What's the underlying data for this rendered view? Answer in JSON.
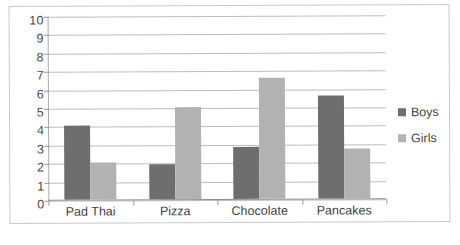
{
  "chart_data": {
    "type": "bar",
    "title": "",
    "subtitle": "",
    "xlabel": "",
    "ylabel": "",
    "categories": [
      "Pad Thai",
      "Pizza",
      "Chocolate",
      "Pancakes"
    ],
    "series": [
      {
        "name": "Boys",
        "color": "#6e6e6e",
        "values": [
          4.0,
          1.9,
          2.8,
          5.6
        ]
      },
      {
        "name": "Girls",
        "color": "#b2b2b2",
        "values": [
          2.0,
          5.0,
          6.6,
          2.7
        ]
      }
    ],
    "ylim": [
      0,
      10
    ],
    "ytick_labels": [
      "10",
      "9",
      "8",
      "7",
      "6",
      "5",
      "4",
      "3",
      "2",
      "1",
      "0"
    ],
    "ytick_values": [
      10,
      9,
      8,
      7,
      6,
      5,
      4,
      3,
      2,
      1,
      0
    ],
    "grid": true,
    "grid_axis": "y",
    "legend_position": "right",
    "legend": [
      "Boys",
      "Girls"
    ],
    "annotations": [],
    "plot_background": "#ffffff",
    "frame_color": "#c9c9c9",
    "gridline_color": "#bdbdbd"
  }
}
